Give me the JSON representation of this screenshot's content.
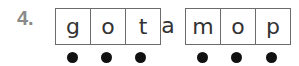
{
  "item_number": "4.",
  "group1": [
    "g",
    "o",
    "t"
  ],
  "loose_letter": "a",
  "group2": [
    "m",
    "o",
    "p"
  ],
  "dot_count": 6
}
